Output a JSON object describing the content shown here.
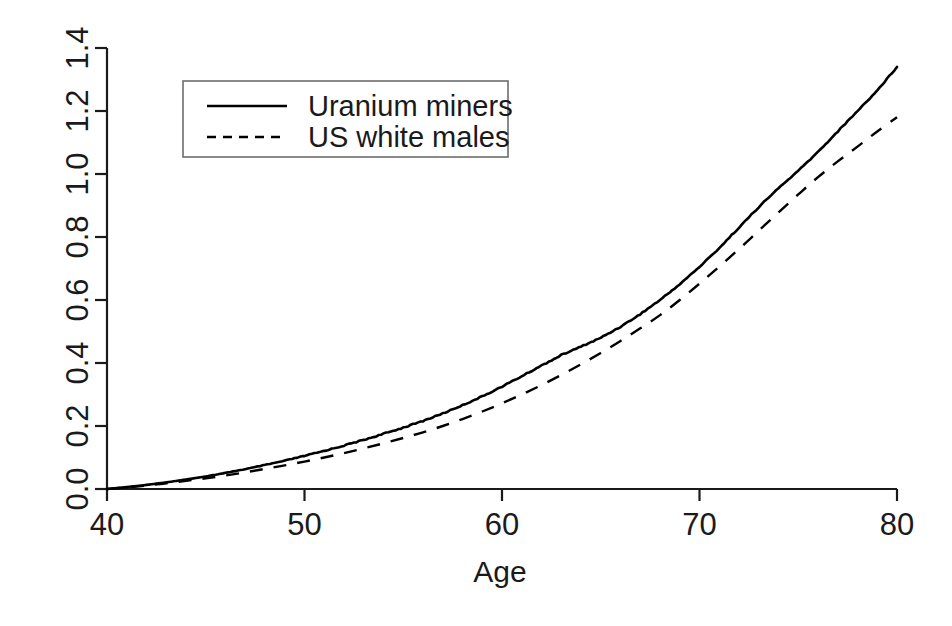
{
  "chart_data": {
    "type": "line",
    "title": "",
    "subtitle": "",
    "xlabel": "Age",
    "ylabel": "",
    "xlim": [
      40,
      80
    ],
    "ylim": [
      0.0,
      1.4
    ],
    "grid": false,
    "legend_position": "top-left",
    "xticks": [
      "40",
      "50",
      "60",
      "70",
      "80"
    ],
    "xtick_values": [
      40,
      50,
      60,
      70,
      80
    ],
    "yticks": [
      "0.0",
      "0.2",
      "0.4",
      "0.6",
      "0.8",
      "1.0",
      "1.2",
      "1.4"
    ],
    "ytick_values": [
      0.0,
      0.2,
      0.4,
      0.6,
      0.8,
      1.0,
      1.2,
      1.4
    ],
    "x": [
      40,
      41,
      42,
      43,
      44,
      45,
      46,
      47,
      48,
      49,
      50,
      51,
      52,
      53,
      54,
      55,
      56,
      57,
      58,
      59,
      60,
      61,
      62,
      63,
      64,
      65,
      66,
      67,
      68,
      69,
      70,
      71,
      72,
      73,
      74,
      75,
      76,
      77,
      78,
      79,
      80
    ],
    "series": [
      {
        "name": "Uranium miners",
        "style": "solid",
        "color": "#000000",
        "values": [
          0.0,
          0.006,
          0.013,
          0.021,
          0.03,
          0.04,
          0.051,
          0.063,
          0.076,
          0.09,
          0.105,
          0.121,
          0.138,
          0.156,
          0.175,
          0.195,
          0.216,
          0.24,
          0.266,
          0.294,
          0.325,
          0.358,
          0.392,
          0.425,
          0.452,
          0.48,
          0.515,
          0.555,
          0.6,
          0.65,
          0.705,
          0.765,
          0.83,
          0.895,
          0.955,
          1.01,
          1.07,
          1.135,
          1.2,
          1.265,
          1.34
        ]
      },
      {
        "name": "US white males",
        "style": "dashed",
        "color": "#000000",
        "values": [
          0.0,
          0.005,
          0.011,
          0.018,
          0.026,
          0.034,
          0.043,
          0.053,
          0.064,
          0.075,
          0.087,
          0.1,
          0.114,
          0.129,
          0.145,
          0.162,
          0.18,
          0.2,
          0.222,
          0.246,
          0.272,
          0.3,
          0.33,
          0.362,
          0.396,
          0.432,
          0.47,
          0.51,
          0.552,
          0.6,
          0.652,
          0.706,
          0.762,
          0.82,
          0.878,
          0.935,
          0.99,
          1.04,
          1.087,
          1.135,
          1.18
        ]
      }
    ],
    "legend": [
      {
        "label": "Uranium miners",
        "style": "solid"
      },
      {
        "label": "US white males",
        "style": "dashed"
      }
    ]
  },
  "plot_geometry": {
    "x_px_at_min": 107,
    "x_px_at_max": 897,
    "y_px_at_min": 489,
    "y_px_at_max": 48,
    "legend_box": {
      "x": 183,
      "y": 81,
      "width": 325,
      "height": 76
    }
  }
}
